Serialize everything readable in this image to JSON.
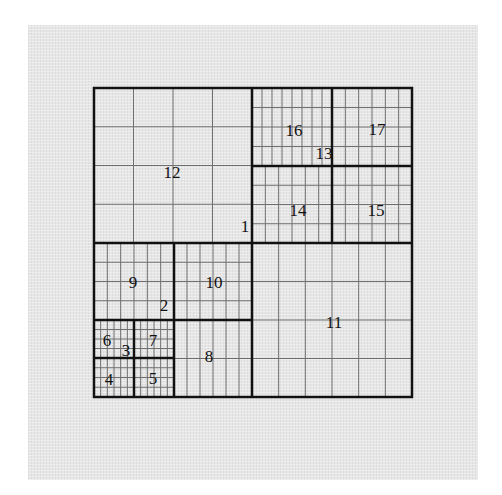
{
  "diagram": {
    "type": "quadtree-grid",
    "outer_box": {
      "x": 94,
      "y": 88,
      "w": 318,
      "h": 309
    },
    "colors": {
      "background": "#ffffff",
      "panel": "#e6e6e6",
      "thick_line": "#111111",
      "thin_line": "#6f6f6f"
    },
    "cells": [
      {
        "id": "12",
        "x": 94,
        "y": 88,
        "w": 158,
        "h": 155,
        "div_x": 4,
        "div_y": 4
      },
      {
        "id": "16",
        "x": 252,
        "y": 88,
        "w": 80,
        "h": 78,
        "div_x": 8,
        "div_y": 4
      },
      {
        "id": "17",
        "x": 332,
        "y": 88,
        "w": 80,
        "h": 78,
        "div_x": 6,
        "div_y": 4
      },
      {
        "id": "14",
        "x": 252,
        "y": 166,
        "w": 80,
        "h": 77,
        "div_x": 6,
        "div_y": 4
      },
      {
        "id": "15",
        "x": 332,
        "y": 166,
        "w": 80,
        "h": 77,
        "div_x": 6,
        "div_y": 4
      },
      {
        "id": "9",
        "x": 94,
        "y": 243,
        "w": 80,
        "h": 77,
        "div_x": 6,
        "div_y": 4
      },
      {
        "id": "10",
        "x": 174,
        "y": 243,
        "w": 78,
        "h": 77,
        "div_x": 6,
        "div_y": 4
      },
      {
        "id": "6",
        "x": 94,
        "y": 320,
        "w": 40,
        "h": 38,
        "div_x": 6,
        "div_y": 4
      },
      {
        "id": "7",
        "x": 134,
        "y": 320,
        "w": 40,
        "h": 38,
        "div_x": 6,
        "div_y": 4
      },
      {
        "id": "4",
        "x": 94,
        "y": 358,
        "w": 40,
        "h": 39,
        "div_x": 6,
        "div_y": 4
      },
      {
        "id": "5",
        "x": 134,
        "y": 358,
        "w": 40,
        "h": 39,
        "div_x": 6,
        "div_y": 4
      },
      {
        "id": "8",
        "x": 174,
        "y": 320,
        "w": 78,
        "h": 77,
        "div_x": 6,
        "div_y": 2
      },
      {
        "id": "11",
        "x": 252,
        "y": 243,
        "w": 160,
        "h": 154,
        "div_x": 6,
        "div_y": 4
      }
    ],
    "thick_lines": [
      [
        252,
        88,
        252,
        397
      ],
      [
        94,
        243,
        412,
        243
      ],
      [
        332,
        88,
        332,
        243
      ],
      [
        252,
        166,
        412,
        166
      ],
      [
        174,
        243,
        174,
        397
      ],
      [
        94,
        320,
        252,
        320
      ],
      [
        134,
        320,
        134,
        397
      ],
      [
        94,
        358,
        174,
        358
      ]
    ],
    "labels": [
      {
        "text": "12",
        "x": 172,
        "y": 178
      },
      {
        "text": "1",
        "x": 245,
        "y": 232
      },
      {
        "text": "16",
        "x": 294,
        "y": 136
      },
      {
        "text": "13",
        "x": 324,
        "y": 159
      },
      {
        "text": "17",
        "x": 377,
        "y": 135
      },
      {
        "text": "14",
        "x": 298,
        "y": 216
      },
      {
        "text": "15",
        "x": 376,
        "y": 216
      },
      {
        "text": "9",
        "x": 133,
        "y": 288
      },
      {
        "text": "10",
        "x": 214,
        "y": 288
      },
      {
        "text": "2",
        "x": 164,
        "y": 311
      },
      {
        "text": "6",
        "x": 107,
        "y": 346
      },
      {
        "text": "3",
        "x": 126,
        "y": 356
      },
      {
        "text": "7",
        "x": 153,
        "y": 346
      },
      {
        "text": "8",
        "x": 209,
        "y": 362
      },
      {
        "text": "4",
        "x": 109,
        "y": 385
      },
      {
        "text": "5",
        "x": 153,
        "y": 384
      },
      {
        "text": "11",
        "x": 334,
        "y": 328
      }
    ]
  }
}
